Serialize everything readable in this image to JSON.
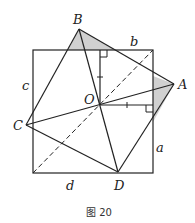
{
  "figure": {
    "caption": "图 20",
    "points": {
      "A": "A",
      "B": "B",
      "C": "C",
      "D": "D",
      "O": "O"
    },
    "sides": {
      "a": "a",
      "b": "b",
      "c": "c",
      "d": "d"
    },
    "colors": {
      "stroke": "#222222",
      "shade": "#d0d0d0"
    }
  }
}
